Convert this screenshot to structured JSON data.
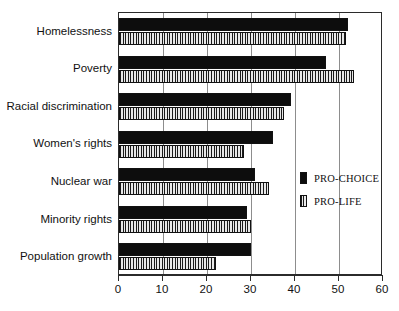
{
  "chart_data": {
    "type": "bar",
    "orientation": "horizontal",
    "title": "",
    "xlabel": "",
    "ylabel": "",
    "xlim": [
      0,
      60
    ],
    "xticks": [
      0,
      10,
      20,
      30,
      40,
      50,
      60
    ],
    "grid": true,
    "legend_position": "inside-right",
    "categories": [
      "Homelessness",
      "Poverty",
      "Racial discrimination",
      "Women's rights",
      "Nuclear war",
      "Minority rights",
      "Population growth"
    ],
    "series": [
      {
        "name": "PRO-CHOICE",
        "color": "#0d0d0d",
        "pattern": "solid",
        "values": [
          52,
          47,
          39,
          35,
          31,
          29,
          30
        ]
      },
      {
        "name": "PRO-LIFE",
        "color": "#d8d8d8",
        "pattern": "vertical-stripes",
        "values": [
          51.5,
          53.5,
          37.5,
          28.5,
          34,
          30,
          22
        ]
      }
    ]
  },
  "legend": {
    "entries": [
      {
        "label": "PRO-CHOICE"
      },
      {
        "label": "PRO-LIFE"
      }
    ]
  }
}
